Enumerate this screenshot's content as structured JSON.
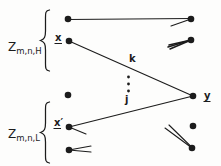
{
  "diagram": {
    "colors": {
      "ink": "#1c1c1c",
      "background": "#fdfdfc"
    },
    "groups": [
      {
        "name": "high",
        "label_base": "Z",
        "label_subscript": "m,n,H"
      },
      {
        "name": "low",
        "label_base": "Z",
        "label_subscript": "m,n,L"
      }
    ],
    "node_labels": {
      "x": "x",
      "x_prime": "x′",
      "y": "y"
    },
    "edge_labels": {
      "k": "k",
      "j": "j"
    },
    "icons": {
      "vertical_ellipsis": "vertical-ellipsis (three stacked dots)",
      "node_dot": "filled circle node marker"
    }
  }
}
